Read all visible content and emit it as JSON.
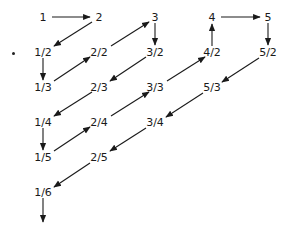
{
  "diagram": {
    "title": "",
    "nodes": [
      {
        "id": "n1",
        "label": "1",
        "x": 43,
        "y": 17
      },
      {
        "id": "n2",
        "label": "2",
        "x": 99,
        "y": 17
      },
      {
        "id": "n3",
        "label": "3",
        "x": 155,
        "y": 17
      },
      {
        "id": "n4",
        "label": "4",
        "x": 212,
        "y": 17
      },
      {
        "id": "n5",
        "label": "5",
        "x": 268,
        "y": 17
      },
      {
        "id": "n1_2",
        "label": "1/2",
        "x": 43,
        "y": 52
      },
      {
        "id": "n2_2",
        "label": "2/2",
        "x": 99,
        "y": 52
      },
      {
        "id": "n3_2",
        "label": "3/2",
        "x": 155,
        "y": 52
      },
      {
        "id": "n4_2",
        "label": "4/2",
        "x": 212,
        "y": 52
      },
      {
        "id": "n5_2",
        "label": "5/2",
        "x": 268,
        "y": 52
      },
      {
        "id": "n1_3",
        "label": "1/3",
        "x": 43,
        "y": 87
      },
      {
        "id": "n2_3",
        "label": "2/3",
        "x": 99,
        "y": 87
      },
      {
        "id": "n3_3",
        "label": "3/3",
        "x": 155,
        "y": 87
      },
      {
        "id": "n5_3",
        "label": "5/3",
        "x": 212,
        "y": 87
      },
      {
        "id": "n1_4",
        "label": "1/4",
        "x": 43,
        "y": 122
      },
      {
        "id": "n2_4",
        "label": "2/4",
        "x": 99,
        "y": 122
      },
      {
        "id": "n3_4",
        "label": "3/4",
        "x": 155,
        "y": 122
      },
      {
        "id": "n1_5",
        "label": "1/5",
        "x": 43,
        "y": 157
      },
      {
        "id": "n2_5",
        "label": "2/5",
        "x": 99,
        "y": 157
      },
      {
        "id": "n1_6",
        "label": "1/6",
        "x": 43,
        "y": 192
      }
    ],
    "arrows": [
      {
        "from": [
          52,
          17
        ],
        "to": [
          90,
          17
        ]
      },
      {
        "from": [
          92,
          22
        ],
        "to": [
          54,
          46
        ]
      },
      {
        "from": [
          43,
          58
        ],
        "to": [
          43,
          80
        ]
      },
      {
        "from": [
          54,
          81
        ],
        "to": [
          90,
          57
        ]
      },
      {
        "from": [
          111,
          46
        ],
        "to": [
          149,
          22
        ]
      },
      {
        "from": [
          155,
          23
        ],
        "to": [
          155,
          45
        ]
      },
      {
        "from": [
          146,
          57
        ],
        "to": [
          110,
          81
        ]
      },
      {
        "from": [
          92,
          92
        ],
        "to": [
          54,
          116
        ]
      },
      {
        "from": [
          43,
          128
        ],
        "to": [
          43,
          150
        ]
      },
      {
        "from": [
          54,
          151
        ],
        "to": [
          90,
          127
        ]
      },
      {
        "from": [
          111,
          116
        ],
        "to": [
          149,
          92
        ]
      },
      {
        "from": [
          167,
          81
        ],
        "to": [
          205,
          57
        ]
      },
      {
        "from": [
          212,
          46
        ],
        "to": [
          212,
          24
        ]
      },
      {
        "from": [
          221,
          17
        ],
        "to": [
          260,
          17
        ]
      },
      {
        "from": [
          268,
          23
        ],
        "to": [
          268,
          45
        ]
      },
      {
        "from": [
          259,
          58
        ],
        "to": [
          222,
          82
        ]
      },
      {
        "from": [
          203,
          93
        ],
        "to": [
          166,
          117
        ]
      },
      {
        "from": [
          146,
          128
        ],
        "to": [
          110,
          151
        ]
      },
      {
        "from": [
          90,
          163
        ],
        "to": [
          54,
          187
        ]
      },
      {
        "from": [
          43,
          198
        ],
        "to": [
          43,
          222
        ]
      }
    ],
    "colors": {
      "stroke": "#1a1a1a",
      "text": "#1a1a1a",
      "background": "#ffffff"
    }
  }
}
